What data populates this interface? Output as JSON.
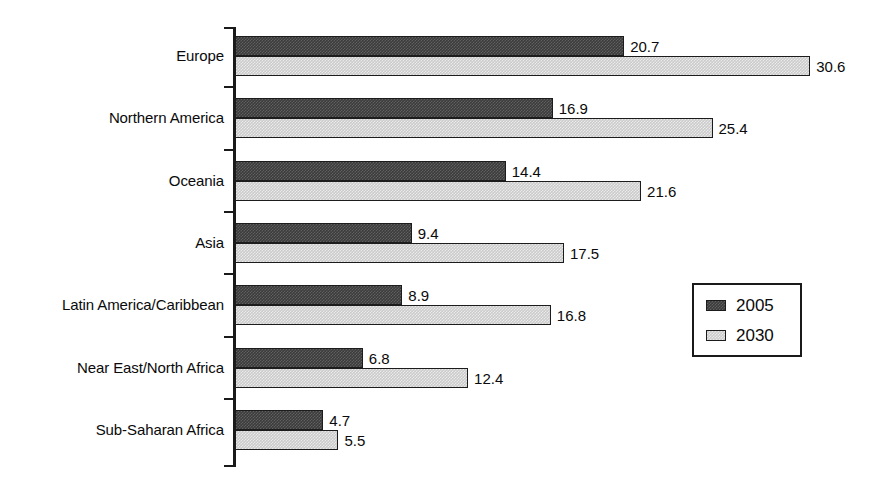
{
  "chart_data": {
    "type": "bar",
    "orientation": "horizontal",
    "title": "",
    "subtitle": "",
    "xlabel": "",
    "ylabel": "",
    "grid": false,
    "xlim": [
      0,
      34
    ],
    "legend": {
      "position": "middle-right",
      "entries": [
        "2005",
        "2030"
      ]
    },
    "categories": [
      "Europe",
      "Northern America",
      "Oceania",
      "Asia",
      "Latin America/Caribbean",
      "Near East/North Africa",
      "Sub-Saharan Africa"
    ],
    "series": [
      {
        "name": "2005",
        "color": "#3b3b3b",
        "values": [
          20.7,
          16.9,
          14.4,
          9.4,
          8.9,
          6.8,
          4.7
        ],
        "labels": [
          "20.7",
          "16.9",
          "14.4",
          "9.4",
          "8.9",
          "6.8",
          "4.7"
        ]
      },
      {
        "name": "2030",
        "color": "#cbcbcb",
        "values": [
          30.6,
          25.4,
          21.6,
          17.5,
          16.8,
          12.4,
          5.5
        ],
        "labels": [
          "30.6",
          "25.4",
          "21.6",
          "17.5",
          "16.8",
          "12.4",
          "5.5"
        ]
      }
    ]
  },
  "axis": {
    "line_color": "#1a1a1a"
  },
  "legend": {
    "entries": [
      {
        "label": "2005",
        "swatch": "dark-swatch"
      },
      {
        "label": "2030",
        "swatch": "light-swatch"
      }
    ]
  }
}
